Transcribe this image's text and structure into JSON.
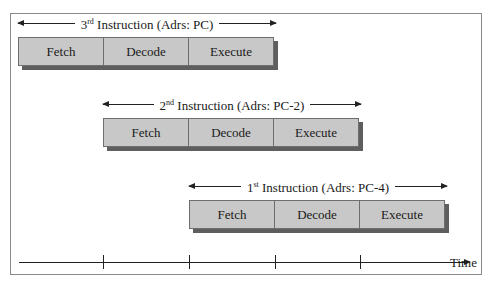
{
  "diagram": {
    "stages": [
      "Fetch",
      "Decode",
      "Execute"
    ],
    "instructions": [
      {
        "ordinal_num": "3",
        "ordinal_suffix": "rd",
        "label_rest": " Instruction (Adrs: PC)",
        "stages": [
          "Fetch",
          "Decode",
          "Execute"
        ],
        "start_slot": 0
      },
      {
        "ordinal_num": "2",
        "ordinal_suffix": "nd",
        "label_rest": " Instruction (Adrs: PC-2)",
        "stages": [
          "Fetch",
          "Decode",
          "Execute"
        ],
        "start_slot": 1
      },
      {
        "ordinal_num": "1",
        "ordinal_suffix": "st",
        "label_rest": " Instruction (Adrs: PC-4)",
        "stages": [
          "Fetch",
          "Decode",
          "Execute"
        ],
        "start_slot": 2
      }
    ],
    "axis": {
      "label": "Time",
      "tick_count": 4
    },
    "colors": {
      "stage_fill": "#c8c8c8",
      "stage_border": "#6e6e6e",
      "shadow": "#5e5e5e",
      "line": "#222222",
      "frame": "#8a8a8a"
    }
  }
}
